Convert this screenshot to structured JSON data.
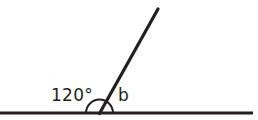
{
  "diagram": {
    "type": "geometry-angle-diagram",
    "stroke_color": "#231f20",
    "background_color": "#ffffff",
    "labels": {
      "angle_measure": "120°",
      "unknown_angle": "b"
    },
    "geometry": {
      "baseline": {
        "x1": 0,
        "y1": 113,
        "x2": 253,
        "y2": 113,
        "stroke_width": 3
      },
      "ray": {
        "x1": 99.5,
        "y1": 113,
        "x2": 158,
        "y2": 9,
        "stroke_width": 3.2
      },
      "vertex": {
        "x": 99.5,
        "y": 113
      },
      "angle_arc": {
        "cx": 99.5,
        "cy": 113,
        "r": 13.5,
        "start_deg": 180,
        "end_deg": 0,
        "stroke_width": 2
      }
    },
    "values": {
      "known_angle_degrees": 120,
      "unknown_angle_degrees": 60,
      "straight_line_total_degrees": 180
    }
  }
}
